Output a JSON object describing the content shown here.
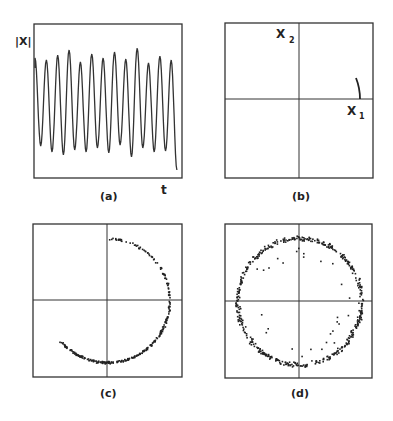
{
  "figure": {
    "panels": [
      {
        "id": "a",
        "caption": "(a)",
        "ylabel": "|X|",
        "xlabel": "t"
      },
      {
        "id": "b",
        "caption": "(b)",
        "xlabel": "X",
        "xlabel_sub": "1",
        "ylabel": "X",
        "ylabel_sub": "2"
      },
      {
        "id": "c",
        "caption": "(c)"
      },
      {
        "id": "d",
        "caption": "(d)"
      }
    ]
  },
  "chart_data": [
    {
      "panel": "a",
      "type": "line",
      "title": "",
      "xlabel": "t",
      "ylabel": "|X|",
      "grid": false,
      "description": "Oscillating time series of |X| with ~13 peaks of slightly varying amplitude",
      "peaks_y_px": [
        58,
        60,
        55,
        50,
        62,
        54,
        58,
        52,
        59,
        48,
        63,
        56,
        60
      ],
      "troughs_y_px": [
        146,
        152,
        155,
        150,
        152,
        148,
        153,
        145,
        157,
        148,
        152,
        151,
        170
      ]
    },
    {
      "panel": "b",
      "type": "line",
      "xlabel": "X1",
      "ylabel": "X2",
      "description": "Phase plane with a short arc segment near the positive X1 axis",
      "arc": {
        "start": [
          0.82,
          0.27
        ],
        "end": [
          0.85,
          0.0
        ]
      }
    },
    {
      "panel": "c",
      "type": "scatter",
      "description": "Partial circular arc of points from top (angle 90°) clockwise through right to lower-left (about 220°)",
      "radius_frac": 0.82,
      "arc_deg": [
        90,
        -140
      ]
    },
    {
      "panel": "d",
      "type": "scatter",
      "description": "Noisy full circle of scattered points around the origin",
      "radius_frac": 0.82
    }
  ]
}
